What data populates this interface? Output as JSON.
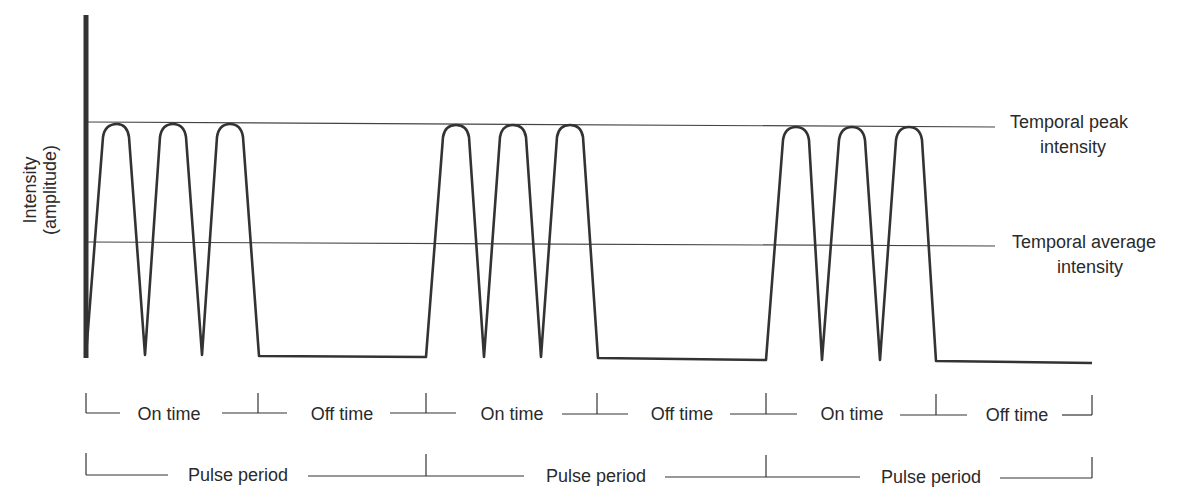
{
  "diagram": {
    "y_axis_label": [
      "Intensity",
      "(amplitude)"
    ],
    "reference_lines": [
      {
        "label_line1": "Temporal peak",
        "label_line2": "intensity"
      },
      {
        "label_line1": "Temporal average",
        "label_line2": "intensity"
      }
    ],
    "timing_row": {
      "segments": [
        {
          "label": "On time"
        },
        {
          "label": "Off time"
        },
        {
          "label": "On time"
        },
        {
          "label": "Off time"
        },
        {
          "label": "On time"
        },
        {
          "label": "Off time"
        }
      ]
    },
    "period_row": {
      "segments": [
        {
          "label": "Pulse period"
        },
        {
          "label": "Pulse period"
        },
        {
          "label": "Pulse period"
        }
      ]
    },
    "pulse_trains": 3,
    "pulses_per_train": 3,
    "colors": {
      "line": "#333333",
      "text": "#2a2a2a",
      "background": "#ffffff"
    }
  }
}
